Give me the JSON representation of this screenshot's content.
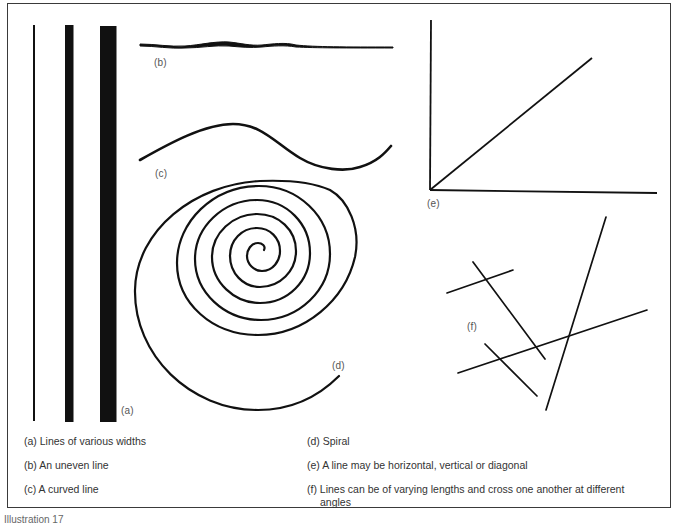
{
  "figure": {
    "footer_label": "Illustration 17",
    "panel_labels": {
      "a": "(a)",
      "b": "(b)",
      "c": "(c)",
      "d": "(d)",
      "e": "(e)",
      "f": "(f)"
    },
    "captions": {
      "a": "(a) Lines of various widths",
      "b": "(b) An uneven line",
      "c": "(c) A curved line",
      "d": "(d) Spiral",
      "e": "(e) A line may be horizontal, vertical or diagonal",
      "f": "(f) Lines can be of varying lengths and cross one another at different angles"
    },
    "colors": {
      "ink": "#111111",
      "frame": "#3a3a3a",
      "label": "#555555",
      "background": "#ffffff"
    }
  }
}
